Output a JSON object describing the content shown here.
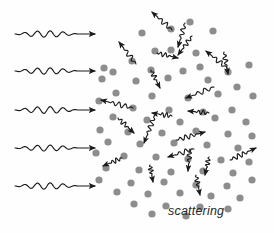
{
  "figure": {
    "caption": "scattering",
    "caption_position": {
      "x": 168,
      "y": 204
    },
    "background_color": "#fefefe",
    "stroke_color": "#1a1a1a",
    "particle_color": "#8d8d8d",
    "width": 274,
    "height": 233
  },
  "chart_data": {
    "type": "scatter",
    "title": "scattering",
    "xlabel": "",
    "ylabel": "",
    "xlim": [
      0,
      274
    ],
    "ylim": [
      0,
      233
    ],
    "grid": false,
    "legend": "none",
    "annotations": [
      "scattering"
    ],
    "series": [
      {
        "name": "incident-waves",
        "kind": "wavy-arrow",
        "direction_deg": 0,
        "count": 5,
        "values": [
          {
            "x1": 15,
            "y1": 34,
            "x2": 95,
            "y2": 34,
            "cycles": 5,
            "amplitude": 3.2
          },
          {
            "x1": 15,
            "y1": 71,
            "x2": 95,
            "y2": 71,
            "cycles": 5,
            "amplitude": 3.2
          },
          {
            "x1": 15,
            "y1": 110,
            "x2": 95,
            "y2": 110,
            "cycles": 5,
            "amplitude": 3.4
          },
          {
            "x1": 15,
            "y1": 148,
            "x2": 95,
            "y2": 148,
            "cycles": 5,
            "amplitude": 3.0
          },
          {
            "x1": 15,
            "y1": 186,
            "x2": 95,
            "y2": 186,
            "cycles": 5,
            "amplitude": 3.2
          }
        ]
      },
      {
        "name": "scattered-waves",
        "kind": "wavy-arrow",
        "count": 22,
        "values": [
          {
            "x1": 172,
            "y1": 30,
            "x2": 152,
            "y2": 12,
            "cycles": 3,
            "amplitude": 2.6
          },
          {
            "x1": 185,
            "y1": 23,
            "x2": 178,
            "y2": 47,
            "cycles": 3,
            "amplitude": 2.4
          },
          {
            "x1": 136,
            "y1": 64,
            "x2": 119,
            "y2": 42,
            "cycles": 3,
            "amplitude": 2.5
          },
          {
            "x1": 192,
            "y1": 36,
            "x2": 178,
            "y2": 55,
            "cycles": 3,
            "amplitude": 2.4
          },
          {
            "x1": 157,
            "y1": 53,
            "x2": 178,
            "y2": 58,
            "cycles": 3,
            "amplitude": 2.4
          },
          {
            "x1": 151,
            "y1": 70,
            "x2": 160,
            "y2": 88,
            "cycles": 3,
            "amplitude": 2.5
          },
          {
            "x1": 227,
            "y1": 68,
            "x2": 206,
            "y2": 51,
            "cycles": 3,
            "amplitude": 2.5
          },
          {
            "x1": 224,
            "y1": 52,
            "x2": 228,
            "y2": 74,
            "cycles": 3,
            "amplitude": 2.4
          },
          {
            "x1": 133,
            "y1": 108,
            "x2": 101,
            "y2": 100,
            "cycles": 4,
            "amplitude": 2.6
          },
          {
            "x1": 118,
            "y1": 118,
            "x2": 134,
            "y2": 133,
            "cycles": 3,
            "amplitude": 2.5
          },
          {
            "x1": 214,
            "y1": 87,
            "x2": 186,
            "y2": 98,
            "cycles": 3,
            "amplitude": 2.5
          },
          {
            "x1": 172,
            "y1": 116,
            "x2": 152,
            "y2": 113,
            "cycles": 3,
            "amplitude": 2.6
          },
          {
            "x1": 209,
            "y1": 113,
            "x2": 188,
            "y2": 111,
            "cycles": 3,
            "amplitude": 2.5
          },
          {
            "x1": 155,
            "y1": 115,
            "x2": 144,
            "y2": 143,
            "cycles": 4,
            "amplitude": 2.5
          },
          {
            "x1": 176,
            "y1": 140,
            "x2": 205,
            "y2": 132,
            "cycles": 4,
            "amplitude": 2.6
          },
          {
            "x1": 190,
            "y1": 149,
            "x2": 188,
            "y2": 171,
            "cycles": 3,
            "amplitude": 2.4
          },
          {
            "x1": 122,
            "y1": 158,
            "x2": 103,
            "y2": 166,
            "cycles": 3,
            "amplitude": 2.5
          },
          {
            "x1": 194,
            "y1": 149,
            "x2": 168,
            "y2": 157,
            "cycles": 3,
            "amplitude": 2.6
          },
          {
            "x1": 230,
            "y1": 160,
            "x2": 256,
            "y2": 148,
            "cycles": 4,
            "amplitude": 2.6
          },
          {
            "x1": 209,
            "y1": 157,
            "x2": 205,
            "y2": 175,
            "cycles": 3,
            "amplitude": 2.4
          },
          {
            "x1": 150,
            "y1": 165,
            "x2": 153,
            "y2": 182,
            "cycles": 3,
            "amplitude": 2.4
          },
          {
            "x1": 196,
            "y1": 175,
            "x2": 200,
            "y2": 195,
            "cycles": 3,
            "amplitude": 2.4
          }
        ]
      },
      {
        "name": "scattering-particles",
        "kind": "dot",
        "radius": 3.6,
        "count": 74,
        "points": [
          [
            171,
            29
          ],
          [
            190,
            22
          ],
          [
            142,
            33
          ],
          [
            171,
            50
          ],
          [
            213,
            31
          ],
          [
            104,
            68
          ],
          [
            132,
            61
          ],
          [
            155,
            51
          ],
          [
            196,
            53
          ],
          [
            200,
            67
          ],
          [
            113,
            72
          ],
          [
            151,
            70
          ],
          [
            183,
            71
          ],
          [
            228,
            72
          ],
          [
            249,
            65
          ],
          [
            102,
            79
          ],
          [
            136,
            81
          ],
          [
            168,
            78
          ],
          [
            208,
            80
          ],
          [
            237,
            87
          ],
          [
            116,
            93
          ],
          [
            152,
            96
          ],
          [
            188,
            98
          ],
          [
            218,
            94
          ],
          [
            253,
            96
          ],
          [
            99,
            101
          ],
          [
            133,
            108
          ],
          [
            169,
            110
          ],
          [
            203,
            112
          ],
          [
            232,
            110
          ],
          [
            113,
            117
          ],
          [
            147,
            120
          ],
          [
            180,
            122
          ],
          [
            215,
            118
          ],
          [
            246,
            122
          ],
          [
            100,
            130
          ],
          [
            128,
            132
          ],
          [
            162,
            133
          ],
          [
            196,
            131
          ],
          [
            228,
            134
          ],
          [
            252,
            136
          ],
          [
            108,
            142
          ],
          [
            140,
            144
          ],
          [
            174,
            143
          ],
          [
            207,
            145
          ],
          [
            238,
            148
          ],
          [
            96,
            153
          ],
          [
            124,
            156
          ],
          [
            156,
            157
          ],
          [
            188,
            159
          ],
          [
            221,
            160
          ],
          [
            249,
            162
          ],
          [
            106,
            168
          ],
          [
            139,
            170
          ],
          [
            171,
            172
          ],
          [
            203,
            171
          ],
          [
            233,
            173
          ],
          [
            99,
            180
          ],
          [
            131,
            183
          ],
          [
            164,
            182
          ],
          [
            196,
            185
          ],
          [
            227,
            186
          ],
          [
            252,
            180
          ],
          [
            117,
            192
          ],
          [
            148,
            194
          ],
          [
            180,
            193
          ],
          [
            211,
            196
          ],
          [
            240,
            198
          ],
          [
            134,
            204
          ],
          [
            166,
            206
          ],
          [
            200,
            207
          ],
          [
            228,
            209
          ],
          [
            186,
            216
          ],
          [
            152,
            214
          ]
        ]
      }
    ]
  }
}
